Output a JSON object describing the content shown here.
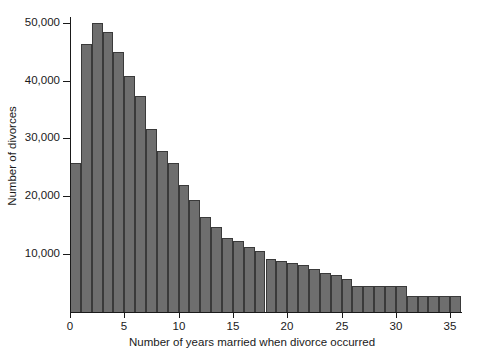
{
  "chart_data": {
    "type": "bar",
    "title": "",
    "xlabel": "Number of years married when divorce occurred",
    "ylabel": "Number of divorces",
    "xlim": [
      0,
      36
    ],
    "ylim": [
      0,
      51000
    ],
    "grid": false,
    "legend": null,
    "bar_color": "#6e6e6e",
    "bar_edge_color": "#3a3a3a",
    "axis_color": "#1a1a1a",
    "bin_width": 1,
    "x_ticks": [
      0,
      5,
      10,
      15,
      20,
      25,
      30,
      35
    ],
    "x_tick_labels": [
      "0",
      "5",
      "10",
      "15",
      "20",
      "25",
      "30",
      "35"
    ],
    "y_ticks": [
      10000,
      20000,
      30000,
      40000,
      50000
    ],
    "y_tick_labels": [
      "10,000",
      "20,000",
      "30,000",
      "40,000",
      "50,000"
    ],
    "bins": [
      {
        "start": 0,
        "end": 1,
        "value": 25800
      },
      {
        "start": 1,
        "end": 2,
        "value": 46400
      },
      {
        "start": 2,
        "end": 3,
        "value": 49900
      },
      {
        "start": 3,
        "end": 4,
        "value": 48400
      },
      {
        "start": 4,
        "end": 5,
        "value": 44900
      },
      {
        "start": 5,
        "end": 6,
        "value": 40800
      },
      {
        "start": 6,
        "end": 7,
        "value": 37300
      },
      {
        "start": 7,
        "end": 8,
        "value": 31600
      },
      {
        "start": 8,
        "end": 9,
        "value": 27900
      },
      {
        "start": 9,
        "end": 10,
        "value": 25800
      },
      {
        "start": 10,
        "end": 11,
        "value": 22000
      },
      {
        "start": 11,
        "end": 12,
        "value": 19300
      },
      {
        "start": 12,
        "end": 13,
        "value": 16500
      },
      {
        "start": 13,
        "end": 14,
        "value": 14700
      },
      {
        "start": 14,
        "end": 15,
        "value": 12800
      },
      {
        "start": 15,
        "end": 16,
        "value": 12300
      },
      {
        "start": 16,
        "end": 17,
        "value": 11300
      },
      {
        "start": 17,
        "end": 18,
        "value": 10500
      },
      {
        "start": 18,
        "end": 19,
        "value": 9200
      },
      {
        "start": 19,
        "end": 20,
        "value": 8900
      },
      {
        "start": 20,
        "end": 21,
        "value": 8500
      },
      {
        "start": 21,
        "end": 22,
        "value": 8100
      },
      {
        "start": 22,
        "end": 23,
        "value": 7500
      },
      {
        "start": 23,
        "end": 24,
        "value": 6800
      },
      {
        "start": 24,
        "end": 25,
        "value": 6400
      },
      {
        "start": 25,
        "end": 26,
        "value": 5700
      },
      {
        "start": 26,
        "end": 27,
        "value": 4500
      },
      {
        "start": 27,
        "end": 28,
        "value": 4500
      },
      {
        "start": 28,
        "end": 29,
        "value": 4500
      },
      {
        "start": 29,
        "end": 30,
        "value": 4500
      },
      {
        "start": 30,
        "end": 31,
        "value": 4500
      },
      {
        "start": 31,
        "end": 32,
        "value": 2700
      },
      {
        "start": 32,
        "end": 33,
        "value": 2700
      },
      {
        "start": 33,
        "end": 34,
        "value": 2700
      },
      {
        "start": 34,
        "end": 35,
        "value": 2700
      },
      {
        "start": 35,
        "end": 36,
        "value": 2700
      }
    ]
  }
}
